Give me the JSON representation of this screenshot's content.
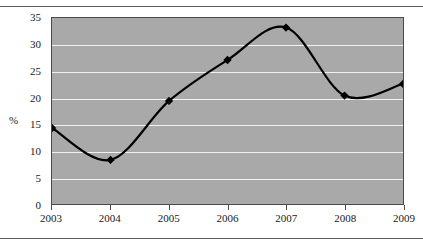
{
  "chart_data": {
    "type": "line",
    "title": "",
    "subtitle": "",
    "xlabel": "",
    "ylabel": "%",
    "categories": [
      "2003",
      "2004",
      "2005",
      "2006",
      "2007",
      "2008",
      "2009"
    ],
    "x": [
      2003,
      2004,
      2005,
      2006,
      2007,
      2008,
      2009
    ],
    "series": [
      {
        "name": "",
        "values": [
          14.3,
          8.3,
          19.4,
          27.1,
          33.2,
          20.4,
          22.6
        ],
        "color": "#000000",
        "marker": "diamond",
        "line_style": "smooth"
      }
    ],
    "ylim": [
      0,
      35
    ],
    "yticks": [
      0,
      5,
      10,
      15,
      20,
      25,
      30,
      35
    ],
    "ytick_labels": [
      "0",
      "5",
      "10",
      "15",
      "20",
      "25",
      "30",
      "35"
    ],
    "xtick_labels": [
      "2003",
      "2004",
      "2005",
      "2006",
      "2007",
      "2008",
      "2009"
    ],
    "grid": true,
    "grid_axis": "y",
    "legend": false,
    "legend_position": "none",
    "plot_background": "#a9a9a9",
    "grid_color": "#f2f2f2",
    "axis_color": "#4a4a4a",
    "annotations": []
  },
  "figure": {
    "rule_top": "",
    "rule_bottom": ""
  }
}
